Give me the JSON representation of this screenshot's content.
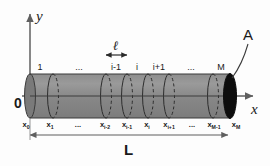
{
  "figure": {
    "type": "diagram",
    "axes": {
      "y_label": "y",
      "x_label": "x",
      "origin_label": "0"
    },
    "segment_marker": {
      "label": "ℓ",
      "description": "segment length double arrow"
    },
    "area_marker": {
      "label": "A",
      "description": "cross sectional area leader to right end cap"
    },
    "length_marker": {
      "label": "L",
      "description": "total length double arrow"
    },
    "segment_labels": [
      "1",
      "...",
      "i-1",
      "i",
      "i+1",
      "...",
      "M"
    ],
    "node_labels": [
      {
        "base": "x",
        "sub": "0"
      },
      {
        "base": "x",
        "sub": "1"
      },
      {
        "base": "...",
        "sub": ""
      },
      {
        "base": "x",
        "sub": "i-2"
      },
      {
        "base": "x",
        "sub": "i-1"
      },
      {
        "base": "x",
        "sub": "i"
      },
      {
        "base": "x",
        "sub": "i+1"
      },
      {
        "base": "...",
        "sub": ""
      },
      {
        "base": "x",
        "sub": "M-1"
      },
      {
        "base": "x",
        "sub": "M"
      }
    ],
    "colors": {
      "cylinder_fill": "#8c8c8c",
      "cylinder_edge": "#3a3a3a",
      "end_cap": "#0d0d0d",
      "axis": "#6b6b6b",
      "text": "#1a1a1a"
    }
  }
}
